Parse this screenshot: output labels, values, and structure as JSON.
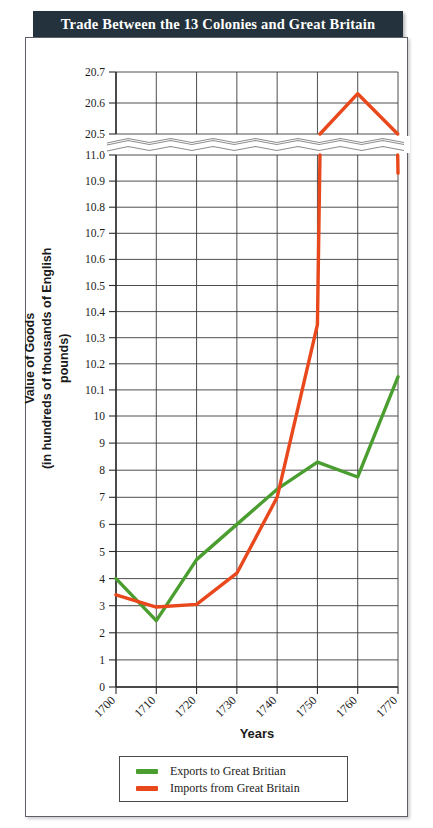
{
  "title": "Trade Between the 13 Colonies and Great Britain",
  "colors": {
    "banner_bg": "#23323c",
    "banner_text": "#ffffff",
    "exports": "#4a9e2f",
    "imports": "#e8481c",
    "frame": "#5d6066",
    "grid": "#3a3a3a"
  },
  "axes": {
    "y_title_line1": "Value of Goods",
    "y_title_line2": "(in hundreds of thousands of English pounds)",
    "x_title": "Years"
  },
  "legend": {
    "items": [
      {
        "label": "Exports to Great Britian",
        "color": "#4a9e2f"
      },
      {
        "label": "Imports from Great Britain",
        "color": "#e8481c"
      }
    ]
  },
  "chart_data": {
    "type": "line",
    "title": "Trade Between the 13 Colonies and Great Britain",
    "xlabel": "Years",
    "ylabel": "Value of Goods (in hundreds of thousands of English pounds)",
    "x": [
      1700,
      1710,
      1720,
      1730,
      1740,
      1750,
      1760,
      1770
    ],
    "xtick_labels": [
      "1700",
      "1710",
      "1720",
      "1730",
      "1740",
      "1750",
      "1760",
      "1770"
    ],
    "grid": true,
    "legend_position": "bottom",
    "axis_break": true,
    "y_lower_ticks": [
      "0",
      "1",
      "2",
      "3",
      "4",
      "5",
      "6",
      "7",
      "8",
      "9",
      "10",
      "10.1",
      "10.2",
      "10.3",
      "10.4",
      "10.5",
      "10.6",
      "10.7",
      "10.8",
      "10.9",
      "11.0"
    ],
    "y_upper_ticks": [
      "20.5",
      "20.6",
      "20.7"
    ],
    "ylim_lower": [
      0,
      11.0
    ],
    "ylim_upper": [
      20.5,
      20.7
    ],
    "series": [
      {
        "name": "Exports to Great Britian",
        "color": "#4a9e2f",
        "values": [
          4.0,
          2.45,
          4.7,
          6.0,
          7.3,
          8.3,
          7.75,
          10.15
        ]
      },
      {
        "name": "Imports from Great Britain",
        "color": "#e8481c",
        "values": [
          3.4,
          2.95,
          3.05,
          4.2,
          7.0,
          10.35,
          20.63,
          10.93
        ]
      }
    ]
  }
}
